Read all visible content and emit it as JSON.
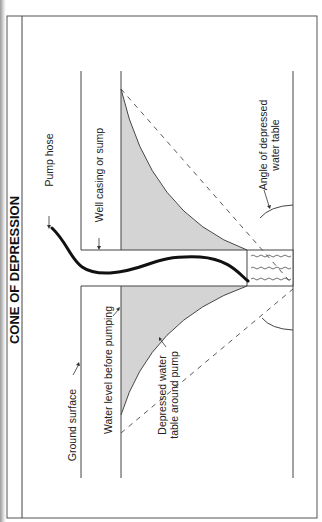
{
  "title": "CONE OF DEPRESSION",
  "labels": {
    "ground_surface": "Ground surface",
    "water_level": "Water level before pumping",
    "depressed_line1": "Depressed water",
    "depressed_line2": "table around pump",
    "pump_hose": "Pump hose",
    "well_casing": "Well casing or sump",
    "angle_line1": "Angle of depressed",
    "angle_line2": "water table"
  },
  "colors": {
    "line": "#3a3a3a",
    "cone_fill": "#d4d4d4",
    "hose": "#111111",
    "background": "#ffffff"
  },
  "orientation": "rotated-90-ccw"
}
